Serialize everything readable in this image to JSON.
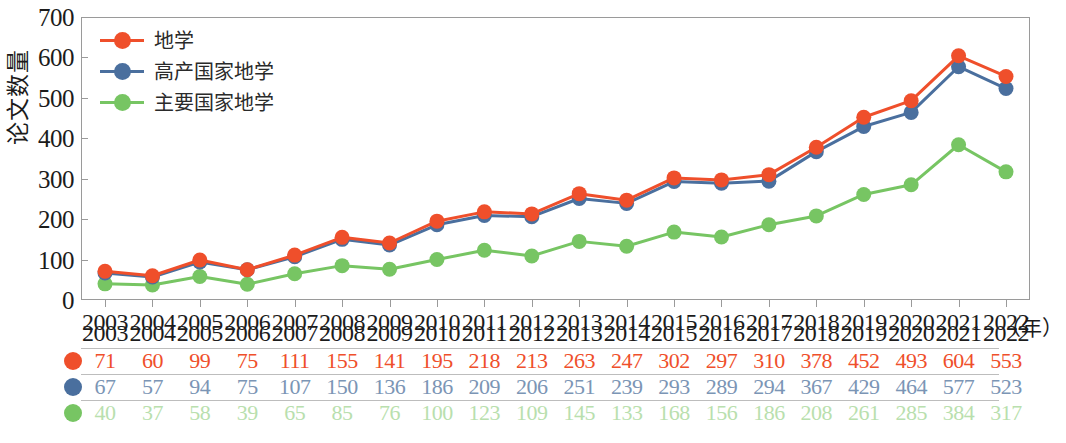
{
  "chart_data": {
    "type": "line",
    "title": "",
    "xlabel": "年",
    "ylabel": "论文数量",
    "ylim": [
      0,
      700
    ],
    "ytick_values": [
      0,
      100,
      200,
      300,
      400,
      500,
      600,
      700
    ],
    "grid": false,
    "legend_position": "top-left",
    "x_unit_label": "（年）",
    "categories": [
      "2003",
      "2004",
      "2005",
      "2006",
      "2007",
      "2008",
      "2009",
      "2010",
      "2011",
      "2012",
      "2013",
      "2014",
      "2015",
      "2016",
      "2017",
      "2018",
      "2019",
      "2020",
      "2021",
      "2022"
    ],
    "series": [
      {
        "name": "地学",
        "color": "#ef4f2b",
        "values": [
          71,
          60,
          99,
          75,
          111,
          155,
          141,
          195,
          218,
          213,
          263,
          247,
          302,
          297,
          310,
          378,
          452,
          493,
          604,
          553
        ]
      },
      {
        "name": "高产国家地学",
        "color": "#4a6f9e",
        "values": [
          67,
          57,
          94,
          75,
          107,
          150,
          136,
          186,
          209,
          206,
          251,
          239,
          293,
          289,
          294,
          367,
          429,
          464,
          577,
          523
        ]
      },
      {
        "name": "主要国家地学",
        "color": "#77c563",
        "values": [
          40,
          37,
          58,
          39,
          65,
          85,
          76,
          100,
          123,
          109,
          145,
          133,
          168,
          156,
          186,
          208,
          261,
          285,
          384,
          317
        ]
      }
    ]
  },
  "legend": {
    "items": [
      {
        "label": "地学",
        "color": "#ef4f2b"
      },
      {
        "label": "高产国家地学",
        "color": "#4a6f9e"
      },
      {
        "label": "主要国家地学",
        "color": "#77c563"
      }
    ]
  },
  "axis": {
    "y_label": "论文数量",
    "y_ticks": [
      "700",
      "600",
      "500",
      "400",
      "300",
      "200",
      "100",
      "0"
    ],
    "x_unit": "（年）"
  },
  "table": {
    "years": [
      "2003",
      "2004",
      "2005",
      "2006",
      "2007",
      "2008",
      "2009",
      "2010",
      "2011",
      "2012",
      "2013",
      "2014",
      "2015",
      "2016",
      "2017",
      "2018",
      "2019",
      "2020",
      "2021",
      "2022"
    ],
    "rows": [
      {
        "series": "地学",
        "color": "#ef4f2b",
        "values": [
          "71",
          "60",
          "99",
          "75",
          "111",
          "155",
          "141",
          "195",
          "218",
          "213",
          "263",
          "247",
          "302",
          "297",
          "310",
          "378",
          "452",
          "493",
          "604",
          "553"
        ]
      },
      {
        "series": "高产国家地学",
        "color": "#7b95b5",
        "values": [
          "67",
          "57",
          "94",
          "75",
          "107",
          "150",
          "136",
          "186",
          "209",
          "206",
          "251",
          "239",
          "293",
          "289",
          "294",
          "367",
          "429",
          "464",
          "577",
          "523"
        ]
      },
      {
        "series": "主要国家地学",
        "color": "#b9dfae",
        "values": [
          "40",
          "37",
          "58",
          "39",
          "65",
          "85",
          "76",
          "100",
          "123",
          "109",
          "145",
          "133",
          "168",
          "156",
          "186",
          "208",
          "261",
          "285",
          "384",
          "317"
        ]
      }
    ]
  }
}
